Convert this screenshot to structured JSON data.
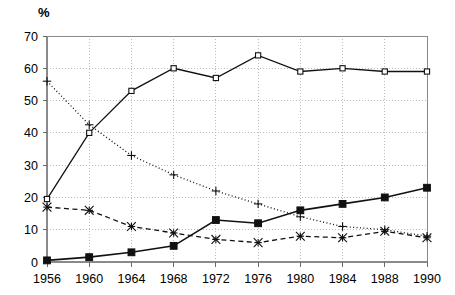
{
  "chart_data": {
    "type": "line",
    "title": "",
    "subtitle": "",
    "xlabel": "",
    "ylabel": "%",
    "unit_label": "%",
    "categories": [
      "1956",
      "1960",
      "1964",
      "1968",
      "1972",
      "1976",
      "1980",
      "1984",
      "1988",
      "1990"
    ],
    "x": [
      1956,
      1960,
      1964,
      1968,
      1972,
      1976,
      1980,
      1984,
      1988,
      1990
    ],
    "xlim": [
      1956,
      1990
    ],
    "ylim": [
      0,
      70
    ],
    "ytick_values": [
      0,
      10,
      20,
      30,
      40,
      50,
      60,
      70
    ],
    "ytick_labels": [
      "0",
      "10",
      "20",
      "30",
      "40",
      "50",
      "60",
      "70"
    ],
    "xtick_labels": [
      "1956",
      "1960",
      "1964",
      "1968",
      "1972",
      "1976",
      "1980",
      "1984",
      "1988",
      "1990"
    ],
    "grid": true,
    "grid_style": "dotted",
    "legend": false,
    "legend_position": "none",
    "series": [
      {
        "name": "series-1",
        "line_style": "solid",
        "marker": "open-square",
        "color": "#111111",
        "values": [
          19.5,
          40.0,
          53.0,
          60.0,
          57.0,
          64.0,
          59.0,
          60.0,
          59.0,
          59.0
        ]
      },
      {
        "name": "series-2",
        "line_style": "dotted",
        "marker": "plus",
        "color": "#111111",
        "values": [
          56.0,
          42.5,
          33.0,
          27.0,
          22.0,
          18.0,
          14.0,
          11.0,
          10.0,
          8.0
        ]
      },
      {
        "name": "series-3",
        "line_style": "dashed",
        "marker": "cross",
        "color": "#111111",
        "values": [
          17.0,
          16.0,
          11.0,
          9.0,
          7.0,
          6.0,
          8.0,
          7.5,
          9.5,
          7.5
        ]
      },
      {
        "name": "series-4",
        "line_style": "solid",
        "marker": "filled-square",
        "color": "#111111",
        "values": [
          0.5,
          1.5,
          3.0,
          5.0,
          13.0,
          12.0,
          16.0,
          18.0,
          20.0,
          23.0
        ]
      }
    ]
  }
}
